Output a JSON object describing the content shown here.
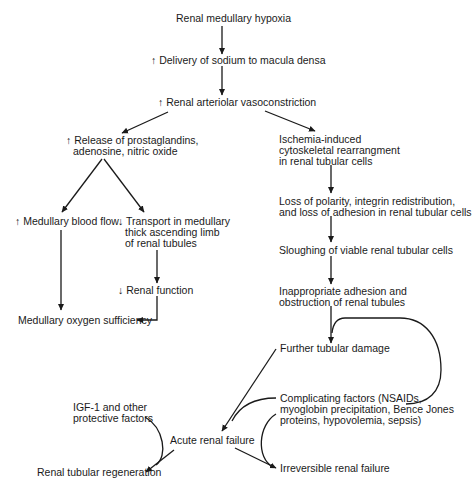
{
  "diagram": {
    "type": "flowchart",
    "title": "",
    "nodes": {
      "hypoxia": {
        "lines": [
          "Renal medullary hypoxia"
        ]
      },
      "sodium": {
        "lines": [
          "↑ Delivery of sodium to macula densa"
        ]
      },
      "vasoconstriction": {
        "lines": [
          "↑ Renal arteriolar vasoconstriction"
        ]
      },
      "prostaglandins": {
        "lines": [
          "↑ Release of prostaglandins,",
          "adenosine, nitric oxide"
        ]
      },
      "ischemia": {
        "lines": [
          "Ischemia-induced",
          "cytoskeletal rearrangment",
          "in renal tubular cells"
        ]
      },
      "blood_flow": {
        "lines": [
          "↑ Medullary blood flow"
        ]
      },
      "transport": {
        "lines": [
          "↓ Transport in medullary",
          "thick ascending limb",
          "of renal tubules"
        ]
      },
      "polarity": {
        "lines": [
          "Loss of polarity, integrin redistribution,",
          "and loss of adhesion in renal tubular cells"
        ]
      },
      "sloughing": {
        "lines": [
          "Sloughing of viable renal tubular cells"
        ]
      },
      "renal_function": {
        "lines": [
          "↓ Renal function"
        ]
      },
      "obstruction": {
        "lines": [
          "Inappropriate adhesion and",
          "obstruction of renal tubules"
        ]
      },
      "oxygen": {
        "lines": [
          "Medullary oxygen sufficiency"
        ]
      },
      "further_damage": {
        "lines": [
          "Further tubular damage"
        ]
      },
      "complicating": {
        "lines": [
          "Complicating factors (NSAIDs,",
          "myoglobin precipitation, Bence Jones",
          "proteins, hypovolemia, sepsis)"
        ]
      },
      "igf": {
        "lines": [
          "IGF-1 and other",
          "protective factors"
        ]
      },
      "acute": {
        "lines": [
          "Acute renal failure"
        ]
      },
      "regeneration": {
        "lines": [
          "Renal tubular regeneration"
        ]
      },
      "irreversible": {
        "lines": [
          "Irreversible renal failure"
        ]
      }
    },
    "edges": [
      {
        "from": "hypoxia",
        "to": "sodium"
      },
      {
        "from": "sodium",
        "to": "vasoconstriction"
      },
      {
        "from": "vasoconstriction",
        "to": "prostaglandins"
      },
      {
        "from": "vasoconstriction",
        "to": "ischemia"
      },
      {
        "from": "prostaglandins",
        "to": "blood_flow"
      },
      {
        "from": "prostaglandins",
        "to": "transport"
      },
      {
        "from": "blood_flow",
        "to": "oxygen"
      },
      {
        "from": "transport",
        "to": "renal_function"
      },
      {
        "from": "renal_function",
        "to": "oxygen"
      },
      {
        "from": "ischemia",
        "to": "polarity"
      },
      {
        "from": "polarity",
        "to": "sloughing"
      },
      {
        "from": "sloughing",
        "to": "obstruction"
      },
      {
        "from": "obstruction",
        "to": "further_damage"
      },
      {
        "from": "complicating",
        "to": "further_damage",
        "style": "feedback-loop"
      },
      {
        "from": "further_damage",
        "to": "acute"
      },
      {
        "from": "complicating",
        "to": "acute",
        "style": "modifier"
      },
      {
        "from": "complicating",
        "to": "irreversible",
        "style": "modifier"
      },
      {
        "from": "acute",
        "to": "irreversible"
      },
      {
        "from": "acute",
        "to": "regeneration"
      },
      {
        "from": "igf",
        "to": "regeneration",
        "style": "modifier"
      }
    ],
    "colors": {
      "ink": "#1a1a1a",
      "background": "#ffffff"
    }
  }
}
